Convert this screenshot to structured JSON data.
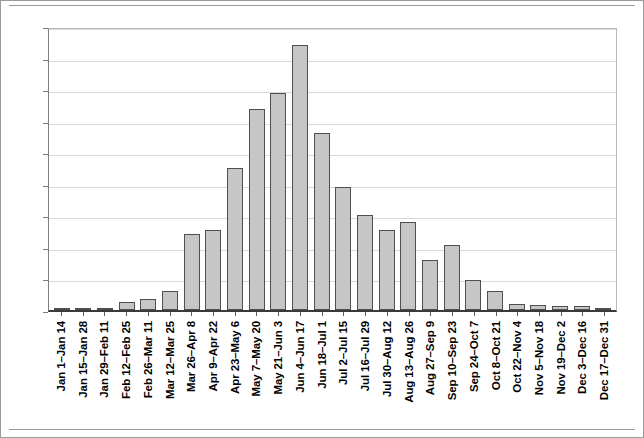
{
  "chart_data": {
    "type": "bar",
    "title": "",
    "xlabel": "",
    "ylabel": "",
    "ylim": [
      0,
      450
    ],
    "yticks": [
      0,
      50,
      100,
      150,
      200,
      250,
      300,
      350,
      400,
      450
    ],
    "grid": true,
    "legend": "none",
    "bar_fill_color": "#c6c6c6",
    "bar_border_color": "#4f4f4f",
    "categories": [
      "Jan 1–Jan 14",
      "Jan 15–Jan 28",
      "Jan 29–Feb 11",
      "Feb 12–Feb 25",
      "Feb 26–Mar 11",
      "Mar 12–Mar 25",
      "Mar 26–Apr 8",
      "Apr 9–Apr 22",
      "Apr 23–May 6",
      "May 7–May 20",
      "May 21–Jun 3",
      "Jun 4–Jun 17",
      "Jun 18–Jul 1",
      "Jul 2–Jul 15",
      "Jul 16–Jul 29",
      "Jul 30–Aug 12",
      "Aug 13–Aug 26",
      "Aug 27–Sep 9",
      "Sep 10–Sep 23",
      "Sep 24–Oct 7",
      "Oct 8–Oct 21",
      "Oct 22–Nov 4",
      "Nov 5–Nov 18",
      "Nov 19–Dec 2",
      "Dec 3–Dec 16",
      "Dec 17–Dec 31"
    ],
    "values": [
      2,
      1,
      1,
      12,
      18,
      30,
      120,
      126,
      225,
      318,
      344,
      420,
      280,
      195,
      150,
      127,
      139,
      79,
      103,
      47,
      30,
      10,
      8,
      7,
      6,
      2
    ]
  }
}
